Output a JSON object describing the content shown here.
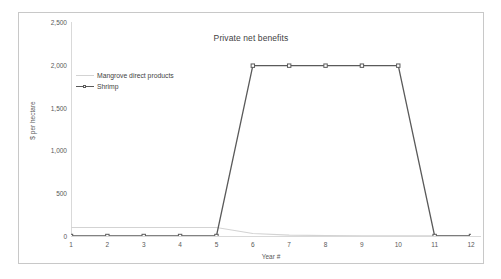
{
  "chart_data": {
    "type": "line",
    "title": "Private net benefits",
    "xlabel": "Year #",
    "ylabel": "$ per hectare",
    "x": [
      1,
      2,
      3,
      4,
      5,
      6,
      7,
      8,
      9,
      10,
      11,
      12
    ],
    "categories": [
      "1",
      "2",
      "3",
      "4",
      "5",
      "6",
      "7",
      "8",
      "9",
      "10",
      "11",
      "12"
    ],
    "xlim": [
      1,
      12
    ],
    "ylim": [
      0,
      2500
    ],
    "yticks": [
      0,
      500,
      1000,
      1500,
      2000,
      2500
    ],
    "ytick_labels": [
      "0",
      "500",
      "1,000",
      "1,500",
      "2,000",
      "2,500"
    ],
    "grid": false,
    "legend_position": "upper left",
    "series": [
      {
        "name": "Mangrove direct products",
        "color": "#d3d3d3",
        "marker": "none",
        "values": [
          100,
          100,
          100,
          100,
          100,
          30,
          10,
          5,
          3,
          2,
          1,
          0
        ]
      },
      {
        "name": "Shrimp",
        "color": "#5a5a5a",
        "marker": "square",
        "values": [
          0,
          0,
          0,
          0,
          0,
          1990,
          1990,
          1990,
          1990,
          1990,
          0,
          0
        ]
      }
    ]
  }
}
